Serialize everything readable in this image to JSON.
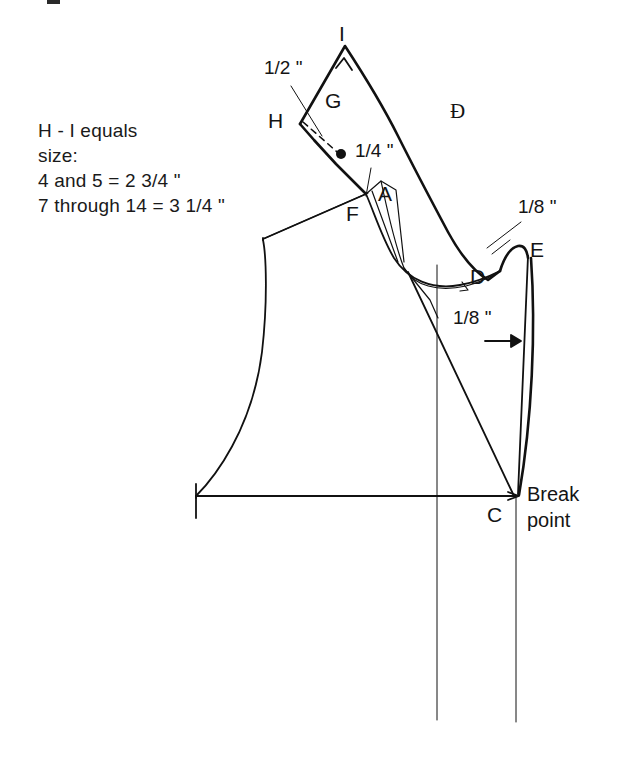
{
  "figure": {
    "kind": "tailoring-pattern-draft",
    "background_color": "#ffffff",
    "line_color": "#111111"
  },
  "notes": {
    "line1": "H - I equals",
    "line2": "size:",
    "line3": "4 and 5 = 2 3/4 \"",
    "line4": "7 through 14 = 3 1/4 \""
  },
  "point_labels": {
    "i": "I",
    "h": "H",
    "g": "G",
    "f": "F",
    "a": "A",
    "d_collar": "Ð",
    "d": "D",
    "e": "E",
    "c": "C"
  },
  "dimensions": {
    "half_inch": "1/2 \"",
    "quarter_inch": "1/4 \"",
    "eighth_inch_top": "1/8 \"",
    "eighth_inch_side": "1/8 \""
  },
  "annotations": {
    "break_point_line1": "Break",
    "break_point_line2": "point"
  }
}
